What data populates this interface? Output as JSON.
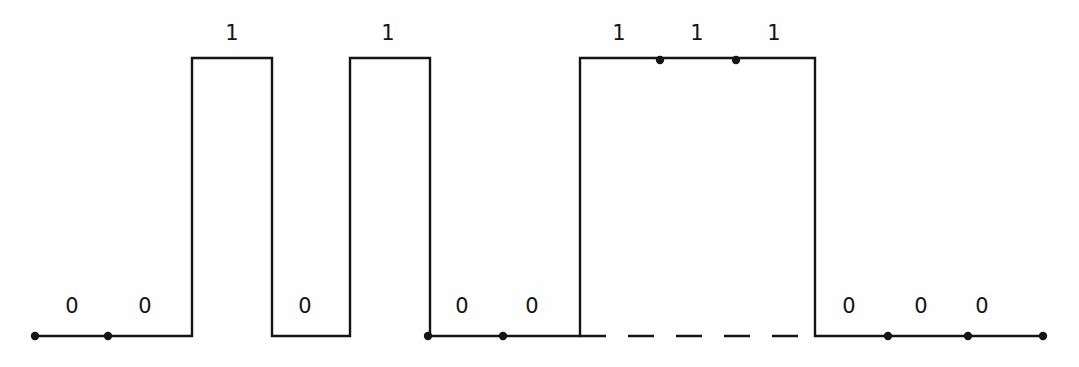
{
  "figure": {
    "name": "digital-waveform-timing-diagram",
    "type": "timing-diagram",
    "width": 1079,
    "height": 367,
    "background_color": "#fefefe",
    "stroke_color": "#141414",
    "stroke_width": 2.4,
    "marker_color": "#141414",
    "marker_radius": 4.2,
    "high_level_y": 58,
    "low_level_y": 336,
    "label_high_y": 33,
    "label_low_y": 306
  },
  "bit_sequence": [
    "0",
    "0",
    "1",
    "0",
    "1",
    "0",
    "0",
    "1",
    "1",
    "1",
    "0",
    "0",
    "0"
  ],
  "labels": [
    {
      "text": "0",
      "x": 72,
      "y": 306,
      "level": "low"
    },
    {
      "text": "0",
      "x": 145,
      "y": 306,
      "level": "low"
    },
    {
      "text": "1",
      "x": 232,
      "y": 33,
      "level": "high"
    },
    {
      "text": "0",
      "x": 305,
      "y": 306,
      "level": "low"
    },
    {
      "text": "1",
      "x": 388,
      "y": 33,
      "level": "high"
    },
    {
      "text": "0",
      "x": 462,
      "y": 306,
      "level": "low"
    },
    {
      "text": "0",
      "x": 532,
      "y": 306,
      "level": "low"
    },
    {
      "text": "1",
      "x": 619,
      "y": 33,
      "level": "high"
    },
    {
      "text": "1",
      "x": 697,
      "y": 33,
      "level": "high"
    },
    {
      "text": "1",
      "x": 774,
      "y": 33,
      "level": "high"
    },
    {
      "text": "0",
      "x": 849,
      "y": 306,
      "level": "low"
    },
    {
      "text": "0",
      "x": 921,
      "y": 306,
      "level": "low"
    },
    {
      "text": "0",
      "x": 982,
      "y": 306,
      "level": "low"
    }
  ],
  "solid_path": "M 33,336 L 192,336 L 192,58 L 272,58 L 272,336 L 350,336 L 350,58 L 430,58 L 430,336 L 580,336 L 580,58 L 815,58 L 815,336 L 1045,336",
  "dashed_segment": {
    "x1": 580,
    "y1": 336,
    "x2": 815,
    "y2": 336,
    "dash_pattern": "26 22"
  },
  "sample_dots": [
    {
      "x": 35,
      "y": 336
    },
    {
      "x": 108,
      "y": 336
    },
    {
      "x": 428,
      "y": 336
    },
    {
      "x": 503,
      "y": 336
    },
    {
      "x": 660,
      "y": 60
    },
    {
      "x": 736,
      "y": 60
    },
    {
      "x": 888,
      "y": 336
    },
    {
      "x": 968,
      "y": 336
    },
    {
      "x": 1043,
      "y": 336
    }
  ]
}
